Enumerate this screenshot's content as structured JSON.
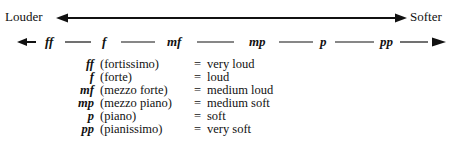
{
  "scale": {
    "left_label": "Louder",
    "right_label": "Softer",
    "dynamics": [
      "ff",
      "f",
      "mf",
      "mp",
      "p",
      "pp"
    ]
  },
  "legend": [
    {
      "symbol": "ff",
      "term": "(fortissimo)",
      "eq": "=",
      "meaning": "very loud"
    },
    {
      "symbol": "f",
      "term": "(forte)",
      "eq": "=",
      "meaning": "loud"
    },
    {
      "symbol": "mf",
      "term": "(mezzo forte)",
      "eq": "=",
      "meaning": "medium loud"
    },
    {
      "symbol": "mp",
      "term": "(mezzo piano)",
      "eq": "=",
      "meaning": "medium soft"
    },
    {
      "symbol": "p",
      "term": "(piano)",
      "eq": "=",
      "meaning": "soft"
    },
    {
      "symbol": "pp",
      "term": "(pianissimo)",
      "eq": "=",
      "meaning": "very soft"
    }
  ],
  "colors": {
    "ink": "#111111",
    "background": "#ffffff"
  }
}
